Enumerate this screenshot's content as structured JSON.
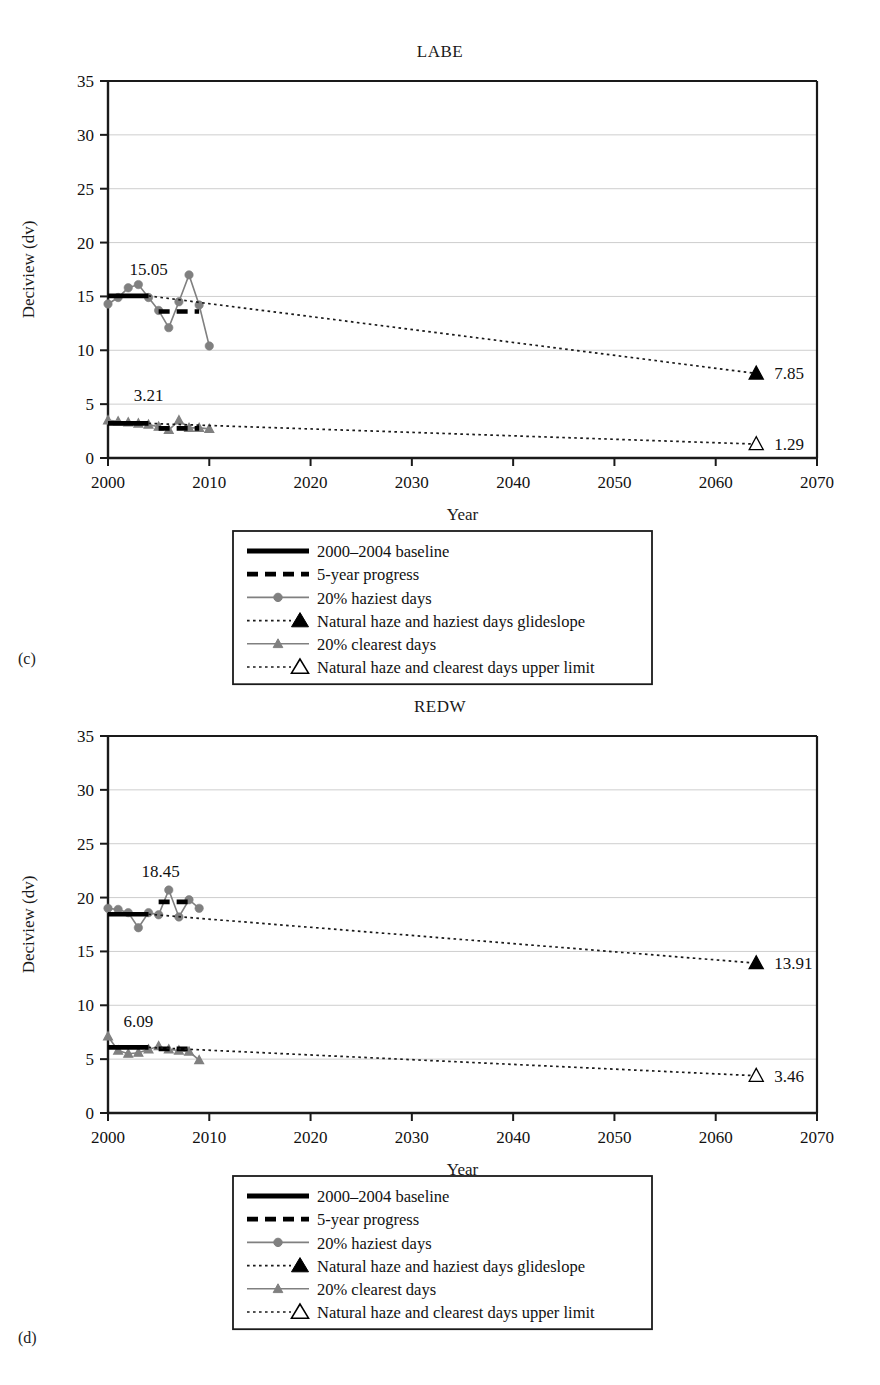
{
  "figure": {
    "panels": [
      {
        "tag": "(c)",
        "title": "LABE"
      },
      {
        "tag": "(d)",
        "title": "REDW"
      }
    ],
    "axis": {
      "xlabel": "Year",
      "ylabel": "Deciview (dv)",
      "xticks": [
        "2000",
        "2010",
        "2020",
        "2030",
        "2040",
        "2050",
        "2060",
        "2070"
      ],
      "yticks": [
        "0",
        "5",
        "10",
        "15",
        "20",
        "25",
        "30",
        "35"
      ]
    },
    "legend": {
      "items": [
        {
          "label": "2000–2004 baseline",
          "marker": "solid-thick-line"
        },
        {
          "label": "5-year progress",
          "marker": "dashed-thick-line"
        },
        {
          "label": "20% haziest days",
          "marker": "line-circle"
        },
        {
          "label": "Natural haze and haziest days glideslope",
          "marker": "dotted-filled-triangle"
        },
        {
          "label": "20% clearest days",
          "marker": "line-triangle"
        },
        {
          "label": "Natural haze and clearest days upper limit",
          "marker": "dotted-open-triangle"
        }
      ]
    },
    "colors": {
      "axis": "#1a1a1a",
      "grid": "#c8c8c8",
      "series_gray": "#808080",
      "baseline_black": "#000000",
      "text": "#111111"
    }
  },
  "chart_data": [
    {
      "type": "line",
      "title": "LABE",
      "panel": "(c)",
      "xlabel": "Year",
      "ylabel": "Deciview (dv)",
      "xlim": [
        2000,
        2070
      ],
      "ylim": [
        0,
        35
      ],
      "xticks": [
        2000,
        2010,
        2020,
        2030,
        2040,
        2050,
        2060,
        2070
      ],
      "yticks": [
        0,
        5,
        10,
        15,
        20,
        25,
        30,
        35
      ],
      "grid": true,
      "legend_position": "below-plot",
      "annotations": [
        {
          "text": "15.05",
          "x": 2004.0,
          "y": 17.0,
          "series": "2000-2004 baseline (haziest)"
        },
        {
          "text": "3.21",
          "x": 2004.0,
          "y": 5.3,
          "series": "2000-2004 baseline (clearest)"
        },
        {
          "text": "7.85",
          "x": 2064.5,
          "y": 7.85,
          "series": "haziest glideslope endpoint"
        },
        {
          "text": "1.29",
          "x": 2064.5,
          "y": 1.29,
          "series": "clearest upper limit endpoint"
        }
      ],
      "series": [
        {
          "name": "20% haziest days",
          "marker": "circle",
          "color": "#808080",
          "x": [
            2000,
            2001,
            2002,
            2003,
            2004,
            2005,
            2006,
            2007,
            2008,
            2009,
            2010
          ],
          "values": [
            14.3,
            14.9,
            15.8,
            16.1,
            14.9,
            13.7,
            12.1,
            14.5,
            17.0,
            14.2,
            10.4
          ]
        },
        {
          "name": "20% clearest days",
          "marker": "triangle",
          "color": "#808080",
          "x": [
            2000,
            2001,
            2002,
            2003,
            2004,
            2005,
            2006,
            2007,
            2008,
            2009,
            2010
          ],
          "values": [
            3.5,
            3.4,
            3.3,
            3.2,
            3.1,
            2.9,
            2.6,
            3.5,
            2.8,
            2.8,
            2.7
          ]
        },
        {
          "name": "2000–2004 baseline (haziest)",
          "marker": "solid-thick-line",
          "color": "#000000",
          "x": [
            2000,
            2004
          ],
          "values": [
            15.05,
            15.05
          ]
        },
        {
          "name": "5-year progress (haziest)",
          "marker": "dashed-thick-line",
          "color": "#000000",
          "x": [
            2005,
            2009
          ],
          "values": [
            13.6,
            13.6
          ]
        },
        {
          "name": "2000–2004 baseline (clearest)",
          "marker": "solid-thick-line",
          "color": "#000000",
          "x": [
            2000,
            2004
          ],
          "values": [
            3.21,
            3.21
          ]
        },
        {
          "name": "5-year progress (clearest)",
          "marker": "dashed-thick-line",
          "color": "#000000",
          "x": [
            2005,
            2009
          ],
          "values": [
            2.75,
            2.75
          ]
        },
        {
          "name": "Natural haze and haziest days glideslope",
          "marker": "dotted-filled-triangle",
          "color": "#1a1a1a",
          "x": [
            2004,
            2064
          ],
          "values": [
            15.05,
            7.85
          ]
        },
        {
          "name": "Natural haze and clearest days upper limit",
          "marker": "dotted-open-triangle",
          "color": "#1a1a1a",
          "x": [
            2004,
            2064
          ],
          "values": [
            3.21,
            1.29
          ]
        }
      ]
    },
    {
      "type": "line",
      "title": "REDW",
      "panel": "(d)",
      "xlabel": "Year",
      "ylabel": "Deciview (dv)",
      "xlim": [
        2000,
        2070
      ],
      "ylim": [
        0,
        35
      ],
      "xticks": [
        2000,
        2010,
        2020,
        2030,
        2040,
        2050,
        2060,
        2070
      ],
      "yticks": [
        0,
        5,
        10,
        15,
        20,
        25,
        30,
        35
      ],
      "grid": true,
      "legend_position": "below-plot",
      "annotations": [
        {
          "text": "18.45",
          "x": 2005.2,
          "y": 21.9,
          "series": "2000-2004 baseline (haziest)"
        },
        {
          "text": "6.09",
          "x": 2003.0,
          "y": 8.0,
          "series": "2000-2004 baseline (clearest)"
        },
        {
          "text": "13.91",
          "x": 2064.5,
          "y": 13.91,
          "series": "haziest glideslope endpoint"
        },
        {
          "text": "3.46",
          "x": 2064.5,
          "y": 3.46,
          "series": "clearest upper limit endpoint"
        }
      ],
      "series": [
        {
          "name": "20% haziest days",
          "marker": "circle",
          "color": "#808080",
          "x": [
            2000,
            2001,
            2002,
            2003,
            2004,
            2005,
            2006,
            2007,
            2008,
            2009
          ],
          "values": [
            19.0,
            18.9,
            18.6,
            17.2,
            18.6,
            18.4,
            20.7,
            18.2,
            19.8,
            19.0
          ]
        },
        {
          "name": "20% clearest days",
          "marker": "triangle",
          "color": "#808080",
          "x": [
            2000,
            2001,
            2002,
            2003,
            2004,
            2005,
            2006,
            2007,
            2008,
            2009
          ],
          "values": [
            7.1,
            5.8,
            5.5,
            5.6,
            5.9,
            6.2,
            5.9,
            5.8,
            5.7,
            4.9
          ]
        },
        {
          "name": "2000–2004 baseline (haziest)",
          "marker": "solid-thick-line",
          "color": "#000000",
          "x": [
            2000,
            2004
          ],
          "values": [
            18.45,
            18.45
          ]
        },
        {
          "name": "5-year progress (haziest)",
          "marker": "dashed-thick-line",
          "color": "#000000",
          "x": [
            2005,
            2008
          ],
          "values": [
            19.6,
            19.6
          ]
        },
        {
          "name": "2000–2004 baseline (clearest)",
          "marker": "solid-thick-line",
          "color": "#000000",
          "x": [
            2000,
            2004
          ],
          "values": [
            6.09,
            6.09
          ]
        },
        {
          "name": "5-year progress (clearest)",
          "marker": "dashed-thick-line",
          "color": "#000000",
          "x": [
            2005,
            2008
          ],
          "values": [
            5.95,
            5.95
          ]
        },
        {
          "name": "Natural haze and haziest days glideslope",
          "marker": "dotted-filled-triangle",
          "color": "#1a1a1a",
          "x": [
            2004,
            2064
          ],
          "values": [
            18.45,
            13.91
          ]
        },
        {
          "name": "Natural haze and clearest days upper limit",
          "marker": "dotted-open-triangle",
          "color": "#1a1a1a",
          "x": [
            2004,
            2064
          ],
          "values": [
            6.09,
            3.46
          ]
        }
      ]
    }
  ]
}
